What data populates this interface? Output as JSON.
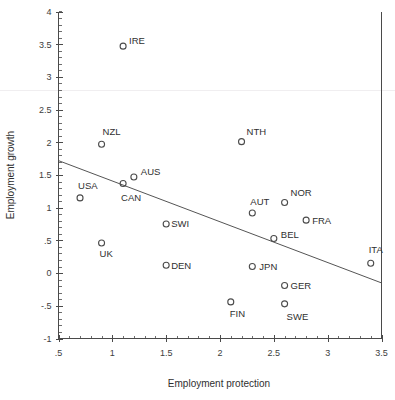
{
  "chart_data": {
    "type": "scatter",
    "title": "",
    "xlabel": "Employment protection",
    "ylabel": "Employment growth",
    "xlim": [
      0.5,
      3.5
    ],
    "ylim": [
      -1,
      4
    ],
    "grid": false,
    "legend": "none",
    "xticks": [
      ".5",
      "1",
      "1.5",
      "2",
      "2.5",
      "3",
      "3.5"
    ],
    "xtick_values": [
      0.5,
      1,
      1.5,
      2,
      2.5,
      3,
      3.5
    ],
    "yticks": [
      "4",
      "3.5",
      "3",
      "2.5",
      "2",
      "1.5",
      "1",
      ".5",
      "0",
      "-.5",
      "-1"
    ],
    "ytick_values": [
      4,
      3.5,
      3,
      2.5,
      2,
      1.5,
      1,
      0.5,
      0,
      -0.5,
      -1
    ],
    "minor_tick_step_x": 0.1,
    "minor_tick_step_y": 0.1,
    "points": [
      {
        "label": "IRE",
        "x": 1.1,
        "y": 3.47,
        "label_dx": 6,
        "label_dy": -2
      },
      {
        "label": "NTH",
        "x": 2.2,
        "y": 2.01,
        "label_dx": 5,
        "label_dy": -7
      },
      {
        "label": "NZL",
        "x": 0.9,
        "y": 1.97,
        "label_dx": 1,
        "label_dy": -9
      },
      {
        "label": "AUS",
        "x": 1.2,
        "y": 1.47,
        "label_dx": 7,
        "label_dy": -2
      },
      {
        "label": "CAN",
        "x": 1.1,
        "y": 1.37,
        "label_dx": -2,
        "label_dy": 17
      },
      {
        "label": "USA",
        "x": 0.7,
        "y": 1.15,
        "label_dx": -2,
        "label_dy": -9
      },
      {
        "label": "NOR",
        "x": 2.6,
        "y": 1.08,
        "label_dx": 6,
        "label_dy": -6
      },
      {
        "label": "AUT",
        "x": 2.3,
        "y": 0.92,
        "label_dx": -2,
        "label_dy": -8
      },
      {
        "label": "FRA",
        "x": 2.8,
        "y": 0.81,
        "label_dx": 6,
        "label_dy": 4
      },
      {
        "label": "SWI",
        "x": 1.5,
        "y": 0.75,
        "label_dx": 5,
        "label_dy": 3
      },
      {
        "label": "BEL",
        "x": 2.5,
        "y": 0.53,
        "label_dx": 7,
        "label_dy": 0
      },
      {
        "label": "UK",
        "x": 0.9,
        "y": 0.46,
        "label_dx": -2,
        "label_dy": 14
      },
      {
        "label": "ITA",
        "x": 3.4,
        "y": 0.15,
        "label_dx": -2,
        "label_dy": -10
      },
      {
        "label": "DEN",
        "x": 1.5,
        "y": 0.12,
        "label_dx": 5,
        "label_dy": 4
      },
      {
        "label": "JPN",
        "x": 2.3,
        "y": 0.1,
        "label_dx": 7,
        "label_dy": 3
      },
      {
        "label": "GER",
        "x": 2.6,
        "y": -0.19,
        "label_dx": 6,
        "label_dy": 3
      },
      {
        "label": "FIN",
        "x": 2.1,
        "y": -0.44,
        "label_dx": -1,
        "label_dy": 15
      },
      {
        "label": "SWE",
        "x": 2.6,
        "y": -0.47,
        "label_dx": 2,
        "label_dy": 16
      }
    ],
    "fit_line": {
      "x0": 0.5,
      "y0": 1.72,
      "x1": 3.5,
      "y1": -0.15
    },
    "colors": {
      "axis": "#4a4a4a",
      "marker_stroke": "#4b4b4b",
      "fit_line": "#555555",
      "text": "#2f2f2f",
      "background": "#ffffff"
    }
  }
}
